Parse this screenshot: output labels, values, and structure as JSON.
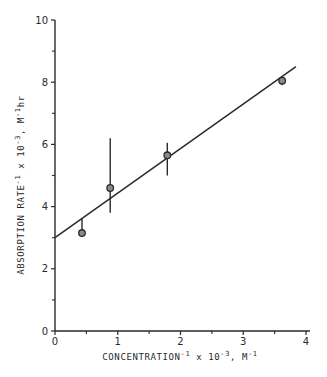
{
  "chart_data": {
    "type": "scatter",
    "title": "",
    "xlabel": {
      "main": "CONCENTRATION",
      "sup1": "-1",
      "mid": " x 10",
      "sup2": "-3",
      "unit": ", M",
      "sup3": "-1"
    },
    "ylabel": {
      "main": "ABSORPTION RATE",
      "sup1": "-1",
      "mid": " x 10",
      "sup2": "-3",
      "unit": ", M",
      "sup3": "-1",
      "tail": "hr"
    },
    "xlim": [
      0,
      4
    ],
    "ylim": [
      0,
      10
    ],
    "x_ticks": [
      0,
      1,
      2,
      3,
      4
    ],
    "x_minor_ticks": [
      0.5,
      1.5,
      2.5,
      3.5
    ],
    "y_ticks": [
      0,
      2,
      4,
      6,
      8,
      10
    ],
    "y_minor_ticks": [
      1,
      3,
      5,
      7,
      9
    ],
    "grid": false,
    "legend": null,
    "series": [
      {
        "name": "measured",
        "x": [
          0.43,
          0.88,
          1.79,
          3.62
        ],
        "y": [
          3.15,
          4.6,
          5.65,
          8.05
        ],
        "error_low": [
          3.05,
          3.8,
          5.0,
          7.9
        ],
        "error_high": [
          3.6,
          6.2,
          6.05,
          8.1
        ]
      },
      {
        "name": "linear fit",
        "type": "line",
        "x": [
          0,
          3.84
        ],
        "y": [
          3.0,
          8.5
        ]
      }
    ],
    "colors": {
      "ink": "#2a2a2a",
      "background": "#ffffff"
    }
  }
}
